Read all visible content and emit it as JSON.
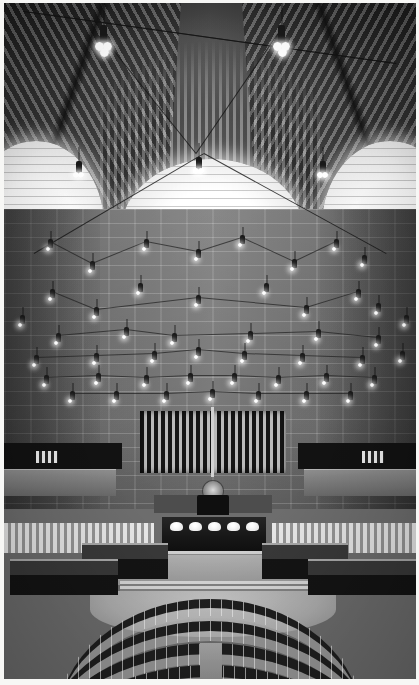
{
  "image": {
    "kind": "photograph",
    "palette": "black-and-white",
    "subject_title": "Assembly Chamber Interior",
    "orientation": "portrait",
    "width_px": 419,
    "height_px": 685,
    "border": "thin white paper margin"
  },
  "colors": {
    "paper_white": "#ffffff",
    "highlight": "#fbfbfa",
    "light_grey": "#b9b9b1",
    "mid_grey": "#87877f",
    "wall_grey": "#6f6f6a",
    "dark_grey": "#4a4a48",
    "shadow_black": "#131312"
  },
  "scene": {
    "ceiling": {
      "label": "groin-vaulted ribbed ceiling",
      "rib_pattern": "radiating fan ribs",
      "arches": [
        {
          "name": "left-arch",
          "label": "glowing arched aperture"
        },
        {
          "name": "center-arch",
          "label": "glowing arched aperture"
        },
        {
          "name": "right-arch",
          "label": "glowing arched aperture"
        }
      ]
    },
    "wall": {
      "label": "coursed stone back wall",
      "screen": {
        "label": "vertical slatted screen / organ front"
      },
      "emblem": {
        "label": "circular state emblem"
      }
    },
    "balconies": [
      {
        "name": "left-balcony",
        "label": "side public gallery"
      },
      {
        "name": "right-balcony",
        "label": "side public gallery"
      }
    ],
    "dais": {
      "speaker_chair_label": "presiding officer chair",
      "rostrum_label": "speaker's rostrum",
      "lamp_count": 5,
      "steps_label": "rostrum steps"
    },
    "floor": {
      "label": "central debating floor"
    },
    "seating": {
      "label": "curved tiered delegate seating",
      "rows": [
        {
          "name": "seat-row-1",
          "tier": 1
        },
        {
          "name": "seat-row-2",
          "tier": 2
        },
        {
          "name": "seat-row-3",
          "tier": 3
        },
        {
          "name": "seat-row-4",
          "tier": 4
        },
        {
          "name": "seat-row-5",
          "tier": 5
        }
      ],
      "aisle_label": "center aisle"
    },
    "lighting": {
      "fixture_label": "suspended pendant lamp",
      "fixture_description": "dark cylindrical housing with white globe shades",
      "array_label": "grid of pendant lamps on tension wires"
    }
  },
  "pendants": {
    "ceiling_cluster": [
      {
        "x": 96,
        "y": 22,
        "size": "large",
        "globes": 3
      },
      {
        "x": 274,
        "y": 22,
        "size": "large",
        "globes": 3
      },
      {
        "x": 192,
        "y": 154,
        "size": "medium",
        "globes": 2
      },
      {
        "x": 72,
        "y": 158,
        "size": "medium",
        "globes": 2
      },
      {
        "x": 316,
        "y": 158,
        "size": "medium",
        "globes": 2
      }
    ],
    "wall_grid": [
      {
        "x": 44,
        "y": 236
      },
      {
        "x": 140,
        "y": 236
      },
      {
        "x": 236,
        "y": 232
      },
      {
        "x": 330,
        "y": 236
      },
      {
        "x": 86,
        "y": 258
      },
      {
        "x": 192,
        "y": 246
      },
      {
        "x": 288,
        "y": 256
      },
      {
        "x": 358,
        "y": 252
      },
      {
        "x": 46,
        "y": 286
      },
      {
        "x": 134,
        "y": 280
      },
      {
        "x": 260,
        "y": 280
      },
      {
        "x": 352,
        "y": 286
      },
      {
        "x": 90,
        "y": 304
      },
      {
        "x": 192,
        "y": 292
      },
      {
        "x": 300,
        "y": 302
      },
      {
        "x": 372,
        "y": 300
      },
      {
        "x": 16,
        "y": 312
      },
      {
        "x": 400,
        "y": 312
      },
      {
        "x": 52,
        "y": 330
      },
      {
        "x": 120,
        "y": 324
      },
      {
        "x": 168,
        "y": 330
      },
      {
        "x": 244,
        "y": 328
      },
      {
        "x": 312,
        "y": 326
      },
      {
        "x": 372,
        "y": 332
      },
      {
        "x": 30,
        "y": 352
      },
      {
        "x": 90,
        "y": 350
      },
      {
        "x": 148,
        "y": 348
      },
      {
        "x": 192,
        "y": 344
      },
      {
        "x": 238,
        "y": 348
      },
      {
        "x": 296,
        "y": 350
      },
      {
        "x": 356,
        "y": 352
      },
      {
        "x": 396,
        "y": 348
      },
      {
        "x": 40,
        "y": 372
      },
      {
        "x": 92,
        "y": 370
      },
      {
        "x": 140,
        "y": 372
      },
      {
        "x": 184,
        "y": 370
      },
      {
        "x": 228,
        "y": 370
      },
      {
        "x": 272,
        "y": 372
      },
      {
        "x": 320,
        "y": 370
      },
      {
        "x": 368,
        "y": 372
      },
      {
        "x": 66,
        "y": 388
      },
      {
        "x": 110,
        "y": 388
      },
      {
        "x": 160,
        "y": 388
      },
      {
        "x": 206,
        "y": 386
      },
      {
        "x": 252,
        "y": 388
      },
      {
        "x": 300,
        "y": 388
      },
      {
        "x": 344,
        "y": 388
      }
    ]
  },
  "seat_rows": [
    {
      "name": "seat-row-1",
      "left": 52,
      "top": 596,
      "width": 308,
      "height": 120
    },
    {
      "name": "seat-row-2",
      "left": 30,
      "top": 618,
      "width": 352,
      "height": 140
    },
    {
      "name": "seat-row-3",
      "left": 8,
      "top": 640,
      "width": 396,
      "height": 160
    },
    {
      "name": "seat-row-4",
      "left": -12,
      "top": 662,
      "width": 436,
      "height": 180
    },
    {
      "name": "seat-row-5",
      "left": -32,
      "top": 684,
      "width": 476,
      "height": 200
    }
  ],
  "benches": [
    {
      "name": "bench-left-inner",
      "left": 78,
      "top": 540,
      "width": 86
    },
    {
      "name": "bench-right-inner",
      "left": 258,
      "top": 540,
      "width": 86
    },
    {
      "name": "bench-left-outer",
      "left": 6,
      "top": 556,
      "width": 108
    },
    {
      "name": "bench-right-outer",
      "left": 304,
      "top": 556,
      "width": 108
    }
  ],
  "crowd_bands": [
    {
      "name": "gallery-crowd-left",
      "left": 0,
      "top": 520,
      "width": 150
    },
    {
      "name": "gallery-crowd-right",
      "left": 268,
      "top": 520,
      "width": 150
    }
  ]
}
